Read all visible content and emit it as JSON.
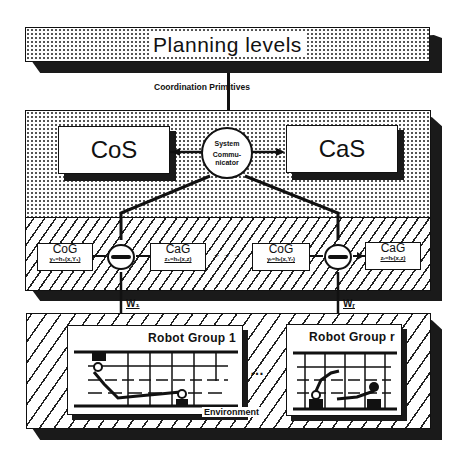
{
  "diagram": {
    "planning": {
      "label": "Planning levels"
    },
    "coordination_primitives": {
      "label": "Coordination Primitives"
    },
    "cos": {
      "label": "CoS"
    },
    "cas": {
      "label": "CaS"
    },
    "system_communicator": {
      "line1": "System",
      "line2": "Commu-",
      "line3": "nicator"
    },
    "cog_boxes": [
      {
        "title": "CoG",
        "formula": "y₁=h₁(x,Y₁)"
      },
      {
        "title": "CaG",
        "formula": "z₁=h₁(x,z)"
      },
      {
        "title": "CoG",
        "formula": "yᵣ=hᵣ(x,Yᵣ)"
      },
      {
        "title": "CaG",
        "formula": "zᵣ=hᵣ(x,z)"
      }
    ],
    "ellipsis": "→ → →",
    "group_communicator": {
      "label": "Group Comm."
    },
    "links": [
      {
        "label": "W₁"
      },
      {
        "label": "Wᵣ"
      }
    ],
    "robot_groups": [
      {
        "label": "Robot Group 1"
      },
      {
        "label": "Robot Group r"
      }
    ],
    "dots_between": "…",
    "environment": {
      "label": "Environment"
    }
  }
}
